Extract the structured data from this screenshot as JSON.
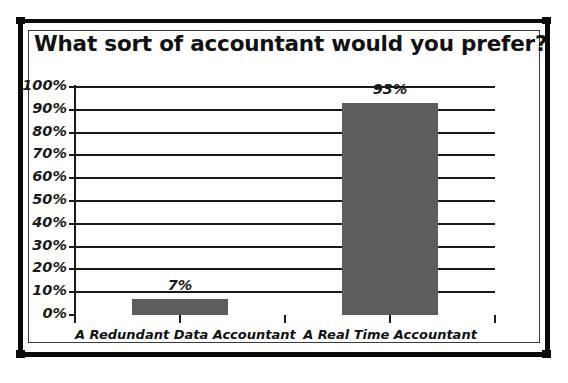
{
  "chart_data": {
    "type": "bar",
    "title": "What sort of accountant would you prefer?",
    "xlabel": "",
    "ylabel": "",
    "categories": [
      "A Redundant Data Accountant",
      "A Real Time Accountant"
    ],
    "values": [
      7,
      93
    ],
    "value_labels": [
      "7%",
      "93%"
    ],
    "ylim": [
      0,
      100
    ],
    "ytick_values": [
      0,
      10,
      20,
      30,
      40,
      50,
      60,
      70,
      80,
      90,
      100
    ],
    "ytick_labels": [
      "0%",
      "10%",
      "20%",
      "30%",
      "40%",
      "50%",
      "60%",
      "70%",
      "80%",
      "90%",
      "100%"
    ],
    "grid": true,
    "legend": false,
    "legend_position": "none",
    "series": [
      {
        "name": "Responses",
        "values": [
          7,
          93
        ],
        "color": "#5d5d5d"
      }
    ],
    "colors": {
      "bar": "#5d5d5d",
      "axis": "#1a1a1a",
      "grid": "#1a1a1a",
      "text": "#111111",
      "frame": "#0a0a0a",
      "background": "#ffffff"
    }
  }
}
